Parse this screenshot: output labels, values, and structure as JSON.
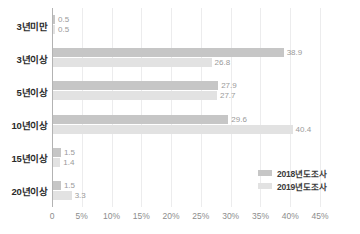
{
  "chart_data": {
    "type": "bar",
    "orientation": "horizontal",
    "title": "",
    "subtitle": "",
    "xlabel": "",
    "ylabel": "",
    "xlim": [
      0,
      45
    ],
    "xticks": [
      0,
      5,
      10,
      15,
      20,
      25,
      30,
      35,
      40,
      45
    ],
    "xtick_labels": [
      "0",
      "5%",
      "10%",
      "15%",
      "20%",
      "25%",
      "30%",
      "35%",
      "40%",
      "45%"
    ],
    "grid": true,
    "grid_axis": "x",
    "legend_position": "inside-lower-right",
    "categories": [
      "3년미만",
      "3년이상",
      "5년이상",
      "10년이상",
      "15년이상",
      "20년이상"
    ],
    "series": [
      {
        "name": "2018년도조사",
        "color": "#c6c6c6",
        "values": [
          0.5,
          38.9,
          27.9,
          29.6,
          1.5,
          1.5
        ],
        "labels": [
          "0.5",
          "38.9",
          "27.9",
          "29.6",
          "1.5",
          "1.5"
        ]
      },
      {
        "name": "2019년도조사",
        "color": "#e2e2e2",
        "values": [
          0.5,
          26.8,
          27.7,
          40.4,
          1.4,
          3.3
        ],
        "labels": [
          "0.5",
          "26.8",
          "27.7",
          "40.4",
          "1.4",
          "3.3"
        ]
      }
    ]
  },
  "colors": {
    "background": "#ffffff",
    "gridline": "#ececed",
    "axis_line": "#b3b3b3",
    "value_label": "#9a9a9a",
    "tick_label": "#8d8d8d",
    "category_label": "#2a2a2a"
  }
}
